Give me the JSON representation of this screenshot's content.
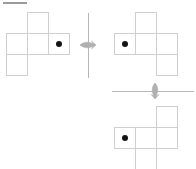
{
  "page": {
    "background_color": "#ffffff",
    "width": 196,
    "height": 169
  },
  "topbar": {
    "label": "header-rule",
    "color": "#9a9a9a"
  },
  "style": {
    "cell_stroke": "#cfcfcf",
    "dot_color": "#141414",
    "axis_color": "#b6b6b6",
    "marker_color": "#b0b0b0",
    "cell_size": 21
  },
  "figures": [
    {
      "id": "net-top-left",
      "name": "cube-net-source",
      "origin": {
        "x": 6,
        "y": 12
      },
      "cells": [
        {
          "name": "cell-top",
          "col": 1,
          "row": 0
        },
        {
          "name": "cell-row-left",
          "col": 0,
          "row": 1
        },
        {
          "name": "cell-row-middle",
          "col": 1,
          "row": 1
        },
        {
          "name": "cell-row-right",
          "col": 2,
          "row": 1
        },
        {
          "name": "cell-bottom",
          "col": 0,
          "row": 2
        }
      ],
      "dot": {
        "col": 2,
        "row": 1
      }
    },
    {
      "id": "net-top-right",
      "name": "cube-net-step-one",
      "origin": {
        "x": 114,
        "y": 12
      },
      "cells": [
        {
          "name": "cell-top",
          "col": 1,
          "row": 0
        },
        {
          "name": "cell-row-left",
          "col": 0,
          "row": 1
        },
        {
          "name": "cell-row-middle",
          "col": 1,
          "row": 1
        },
        {
          "name": "cell-row-right",
          "col": 2,
          "row": 1
        },
        {
          "name": "cell-bottom",
          "col": 2,
          "row": 2
        }
      ],
      "dot": {
        "col": 0,
        "row": 1
      }
    },
    {
      "id": "net-bottom-right",
      "name": "cube-net-step-two",
      "origin": {
        "x": 114,
        "y": 106
      },
      "cells": [
        {
          "name": "cell-top",
          "col": 2,
          "row": 0
        },
        {
          "name": "cell-row-left",
          "col": 0,
          "row": 1
        },
        {
          "name": "cell-row-middle",
          "col": 1,
          "row": 1
        },
        {
          "name": "cell-row-right",
          "col": 2,
          "row": 1
        },
        {
          "name": "cell-bottom",
          "col": 1,
          "row": 2
        }
      ],
      "dot": {
        "col": 0,
        "row": 1
      }
    }
  ],
  "axes": [
    {
      "id": "axis-vertical",
      "name": "vertical-rotation-axis",
      "orientation": "vertical",
      "x": 88,
      "y": 13,
      "length": 65,
      "marker": {
        "name": "rotation-arrow-horizontal",
        "x": 79,
        "y": 40,
        "width": 18,
        "height": 10,
        "direction": "horizontal"
      }
    },
    {
      "id": "axis-horizontal",
      "name": "horizontal-rotation-axis",
      "orientation": "horizontal",
      "x": 112,
      "y": 91,
      "length": 82,
      "marker": {
        "name": "rotation-arrow-vertical",
        "x": 150,
        "y": 82,
        "width": 10,
        "height": 18,
        "direction": "vertical"
      }
    }
  ]
}
